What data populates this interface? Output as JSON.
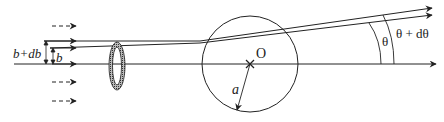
{
  "labels": {
    "impact_outer": "b+db",
    "impact_inner": "b",
    "center": "O",
    "radius": "a",
    "theta": "θ",
    "theta_plus_dtheta": "θ + dθ"
  },
  "geometry": {
    "sphere_center": [
      250,
      64
    ],
    "sphere_radius": 48,
    "ring_center": [
      117,
      66
    ],
    "axis_y": 64
  },
  "colors": {
    "stroke": "#222222",
    "ring_fill": "#555555"
  }
}
